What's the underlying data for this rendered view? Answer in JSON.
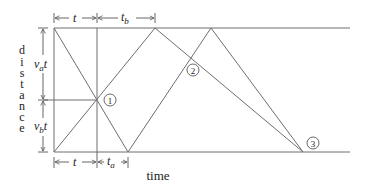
{
  "diagram": {
    "axis_labels": {
      "y": "distance",
      "x": "time"
    },
    "intervals": {
      "top_left": "t",
      "top_right": "t",
      "top_right_sub": "b",
      "bottom_left": "t",
      "bottom_right": "t",
      "bottom_right_sub": "a",
      "left_upper_v": "v",
      "left_upper_sub": "a",
      "left_upper_t": "t",
      "left_lower_v": "v",
      "left_lower_sub": "b",
      "left_lower_t": "t"
    },
    "points": [
      {
        "label": "1"
      },
      {
        "label": "2"
      },
      {
        "label": "3"
      }
    ],
    "vertical_letters": [
      "d",
      "i",
      "s",
      "t",
      "a",
      "n",
      "c",
      "e"
    ]
  }
}
